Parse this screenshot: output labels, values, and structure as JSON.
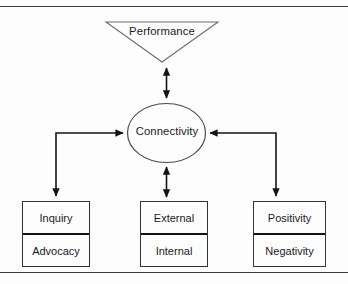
{
  "diagram": {
    "title_shape": {
      "shape": "inverted-triangle",
      "label": "Performance"
    },
    "hub": {
      "shape": "ellipse",
      "label": "Connectivity"
    },
    "boxes": [
      {
        "id": "inquiry-advocacy",
        "top_label": "Inquiry",
        "bottom_label": "Advocacy"
      },
      {
        "id": "external-internal",
        "top_label": "External",
        "bottom_label": "Internal"
      },
      {
        "id": "positivity-negativity",
        "top_label": "Positivity",
        "bottom_label": "Negativity"
      }
    ],
    "connectors": [
      {
        "id": "performance-connectivity",
        "from": "Performance",
        "to": "Connectivity",
        "arrows": "double"
      },
      {
        "id": "connectivity-external",
        "from": "Connectivity",
        "to": "External",
        "arrows": "double"
      },
      {
        "id": "inquiry-connectivity",
        "from": "Inquiry",
        "to": "Connectivity",
        "arrows": "elbow-left"
      },
      {
        "id": "positivity-connectivity",
        "from": "Positivity",
        "to": "Connectivity",
        "arrows": "elbow-right"
      }
    ],
    "colors": {
      "stroke": "#333333",
      "divider": "#141414",
      "frame_rule": "#3a3a3a",
      "text": "#1a1a1a",
      "background": "#fdfdfd"
    }
  }
}
